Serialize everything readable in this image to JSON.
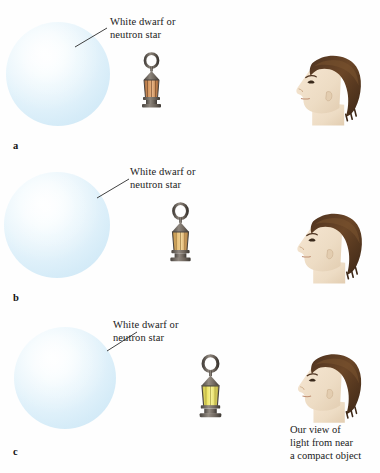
{
  "figure": {
    "background_color": "#fefefe",
    "star_color": "#e2f2fb",
    "panels": [
      {
        "letter": "a",
        "star_label_line1": "White dwarf or",
        "star_label_line2": "neutron star",
        "lantern_name": "lantern-dim",
        "lantern_glow_color": "#c98a52",
        "observer_name": "observer-head-profile"
      },
      {
        "letter": "b",
        "star_label_line1": "White dwarf or",
        "star_label_line2": "neutron star",
        "lantern_name": "lantern-medium",
        "lantern_glow_color": "#ddb066",
        "observer_name": "observer-head-profile"
      },
      {
        "letter": "c",
        "star_label_line1": "White dwarf or",
        "star_label_line2": "neutron star",
        "lantern_name": "lantern-bright",
        "lantern_glow_color": "#e8e06a",
        "observer_name": "observer-head-profile"
      }
    ],
    "caption": {
      "line1": "Our view of",
      "line2": "light from near",
      "line3": "a compact object"
    }
  }
}
